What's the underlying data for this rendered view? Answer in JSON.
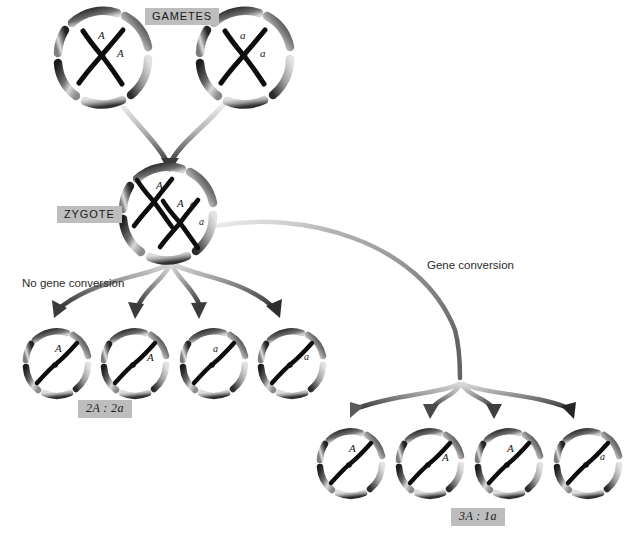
{
  "figure": {
    "background_color": "#ffffff",
    "tag_background": "#bdbdbd",
    "ink_color": "#1a1a1a"
  },
  "labels": {
    "gametes": "GAMETES",
    "zygote": "ZYGOTE",
    "no_gene_conversion": "No gene conversion",
    "gene_conversion": "Gene conversion",
    "ratio_left": "2A : 2a",
    "ratio_right": "3A : 1a"
  },
  "cells": {
    "gametes": [
      {
        "id": "gamete-left",
        "cx": 103,
        "cy": 57,
        "r": 46,
        "chromosomes": 1,
        "alleles": [
          {
            "text": "A",
            "dx": -5,
            "dy": -20
          },
          {
            "text": "A",
            "dx": 14,
            "dy": -2
          }
        ]
      },
      {
        "id": "gamete-right",
        "cx": 245,
        "cy": 57,
        "r": 46,
        "chromosomes": 1,
        "alleles": [
          {
            "text": "a",
            "dx": -5,
            "dy": -20
          },
          {
            "text": "a",
            "dx": 15,
            "dy": -2
          }
        ]
      }
    ],
    "zygote": [
      {
        "id": "zygote",
        "cx": 168,
        "cy": 213,
        "r": 46,
        "chromosomes": 2,
        "alleles": [
          {
            "text": "A",
            "dx": -12,
            "dy": -26
          },
          {
            "text": "A",
            "dx": 9,
            "dy": -8
          },
          {
            "text": "a",
            "dx": 22,
            "dy": -8
          },
          {
            "text": "a",
            "dx": 31,
            "dy": 10
          }
        ]
      }
    ],
    "products_left": [
      {
        "id": "product-left-1",
        "cx": 57,
        "cy": 363,
        "r": 32,
        "allele": "A",
        "adx": -2,
        "ady": -14
      },
      {
        "id": "product-left-2",
        "cx": 135,
        "cy": 363,
        "r": 32,
        "allele": "A",
        "adx": 12,
        "ady": -5
      },
      {
        "id": "product-left-3",
        "cx": 214,
        "cy": 363,
        "r": 32,
        "allele": "a",
        "adx": -1,
        "ady": -14
      },
      {
        "id": "product-left-4",
        "cx": 292,
        "cy": 363,
        "r": 32,
        "allele": "a",
        "adx": 12,
        "ady": -6
      }
    ],
    "products_right": [
      {
        "id": "product-right-1",
        "cx": 351,
        "cy": 463,
        "r": 32,
        "allele": "A",
        "adx": -2,
        "ady": -14
      },
      {
        "id": "product-right-2",
        "cx": 430,
        "cy": 463,
        "r": 32,
        "allele": "A",
        "adx": 12,
        "ady": -5
      },
      {
        "id": "product-right-3",
        "cx": 509,
        "cy": 463,
        "r": 32,
        "allele": "A",
        "adx": -2,
        "ady": -14
      },
      {
        "id": "product-right-4",
        "cx": 588,
        "cy": 463,
        "r": 32,
        "allele": "a",
        "adx": 12,
        "ady": -6
      }
    ]
  },
  "positions": {
    "tag_gametes": {
      "left": 145,
      "top": 8
    },
    "tag_zygote": {
      "left": 57,
      "top": 206
    },
    "label_no_conversion": {
      "left": 22,
      "top": 277
    },
    "label_conversion": {
      "left": 427,
      "top": 259
    },
    "ratio_left": {
      "left": 78,
      "top": 400
    },
    "ratio_right": {
      "left": 451,
      "top": 508
    }
  },
  "arrows": {
    "fusion_left": {
      "from": [
        118,
        104
      ],
      "to": [
        166,
        168
      ]
    },
    "fusion_right": {
      "from": [
        225,
        104
      ],
      "to": [
        172,
        168
      ]
    },
    "split_origin_left": [
      170,
      264
    ],
    "split_targets_left": [
      [
        53,
        322
      ],
      [
        135,
        322
      ],
      [
        199,
        322
      ],
      [
        277,
        322
      ]
    ],
    "split_origin_right": [
      460,
      384
    ],
    "split_targets_right": [
      [
        350,
        422
      ],
      [
        430,
        422
      ],
      [
        494,
        422
      ],
      [
        572,
        422
      ]
    ],
    "conversion_curve": {
      "from": [
        215,
        225
      ],
      "to": [
        460,
        384
      ]
    }
  }
}
